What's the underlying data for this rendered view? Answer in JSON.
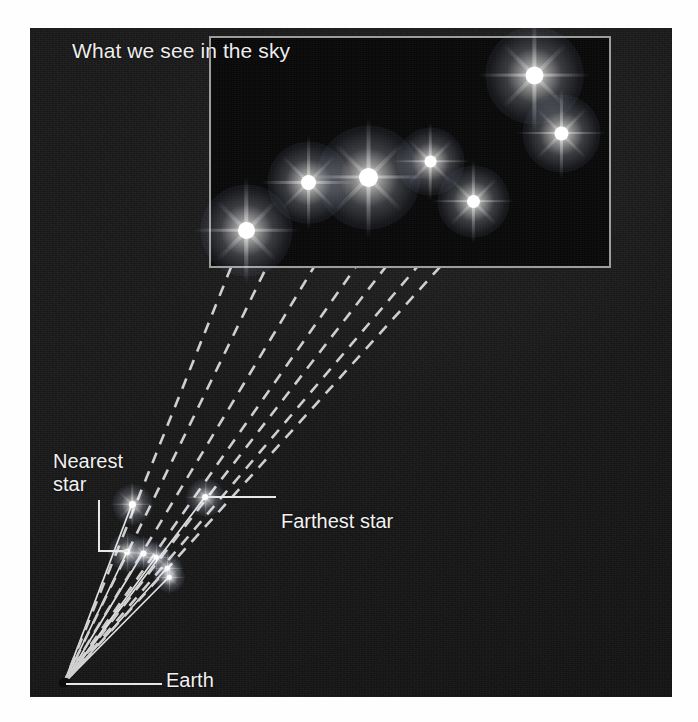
{
  "figure": {
    "domain": "diagram",
    "background_color": "#1b1b1b",
    "page_color": "#ffffff",
    "star_color": "#ffffff",
    "line_color": "#d8d8d8",
    "box_border_color": "#9d9d9d",
    "label_color": "#f2f2f2"
  },
  "sky_box": {
    "title": "What we see in the sky",
    "border_color": "#9d9d9d",
    "x": 179,
    "y": 8,
    "width": 402,
    "height": 232
  },
  "labels": {
    "nearest_star": "Nearest\nstar",
    "farthest_star": "Farthest star",
    "earth": "Earth"
  },
  "earth": {
    "label": "Earth",
    "x": 34,
    "y": 655
  },
  "chart_data": {
    "type": "diagram",
    "title": "What we see in the sky",
    "annotations": [
      "Nearest star",
      "Farthest star",
      "Earth",
      "What we see in the sky"
    ],
    "observer": {
      "name": "Earth",
      "x": 34,
      "y": 655
    },
    "real_stars": [
      {
        "id": "s1",
        "name": "Nearest star",
        "x": 102,
        "y": 476,
        "radius": 3.6,
        "glow": 20,
        "distance_rank": 1
      },
      {
        "id": "s2",
        "name": "star-2",
        "x": 97,
        "y": 524,
        "radius": 3.4,
        "glow": 19,
        "distance_rank": 2
      },
      {
        "id": "s3",
        "name": "star-3",
        "x": 113,
        "y": 525,
        "radius": 3.0,
        "glow": 16,
        "distance_rank": 3
      },
      {
        "id": "s4",
        "name": "star-4",
        "x": 126,
        "y": 529,
        "radius": 2.8,
        "glow": 15,
        "distance_rank": 4
      },
      {
        "id": "s5",
        "name": "star-5",
        "x": 137,
        "y": 540,
        "radius": 2.8,
        "glow": 15,
        "distance_rank": 5
      },
      {
        "id": "s6",
        "name": "star-6",
        "x": 139,
        "y": 549,
        "radius": 2.8,
        "glow": 15,
        "distance_rank": 6
      },
      {
        "id": "s7",
        "name": "Farthest star",
        "x": 175,
        "y": 469,
        "radius": 3.4,
        "glow": 19,
        "distance_rank": 7
      }
    ],
    "apparent_stars": [
      {
        "id": "a1",
        "x": 216,
        "y": 202,
        "radius": 8.5,
        "glow": 46
      },
      {
        "id": "a2",
        "x": 278,
        "y": 154,
        "radius": 7.5,
        "glow": 41
      },
      {
        "id": "a3",
        "x": 338,
        "y": 149,
        "radius": 9.5,
        "glow": 52
      },
      {
        "id": "a4",
        "x": 400,
        "y": 133,
        "radius": 6.0,
        "glow": 34
      },
      {
        "id": "a5",
        "x": 443,
        "y": 173,
        "radius": 6.5,
        "glow": 36
      },
      {
        "id": "a6",
        "x": 504,
        "y": 47,
        "radius": 9.0,
        "glow": 49
      },
      {
        "id": "a7",
        "x": 531,
        "y": 105,
        "radius": 7.0,
        "glow": 39
      }
    ],
    "sight_lines_dashed": [
      {
        "from": "a1",
        "x1": 216,
        "y1": 202,
        "x2": 34,
        "y2": 655
      },
      {
        "from": "a2",
        "x1": 278,
        "y1": 154,
        "x2": 34,
        "y2": 655
      },
      {
        "from": "a3",
        "x1": 338,
        "y1": 149,
        "x2": 34,
        "y2": 655
      },
      {
        "from": "a4",
        "x1": 400,
        "y1": 133,
        "x2": 34,
        "y2": 655
      },
      {
        "from": "a5",
        "x1": 443,
        "y1": 173,
        "x2": 34,
        "y2": 655
      },
      {
        "from": "a6",
        "x1": 504,
        "y1": 47,
        "x2": 34,
        "y2": 655
      },
      {
        "from": "a7",
        "x1": 531,
        "y1": 105,
        "x2": 34,
        "y2": 655
      }
    ],
    "sight_lines_solid": [
      {
        "to": "s1",
        "x1": 34,
        "y1": 655,
        "x2": 102,
        "y2": 476
      },
      {
        "to": "s7",
        "x1": 34,
        "y1": 655,
        "x2": 175,
        "y2": 469
      },
      {
        "to": "s2",
        "x1": 34,
        "y1": 655,
        "x2": 97,
        "y2": 524
      },
      {
        "to": "s3",
        "x1": 34,
        "y1": 655,
        "x2": 113,
        "y2": 525
      },
      {
        "to": "s4",
        "x1": 34,
        "y1": 655,
        "x2": 126,
        "y2": 529
      },
      {
        "to": "s5",
        "x1": 34,
        "y1": 655,
        "x2": 137,
        "y2": 540
      },
      {
        "to": "s6",
        "x1": 34,
        "y1": 655,
        "x2": 139,
        "y2": 549
      }
    ]
  }
}
